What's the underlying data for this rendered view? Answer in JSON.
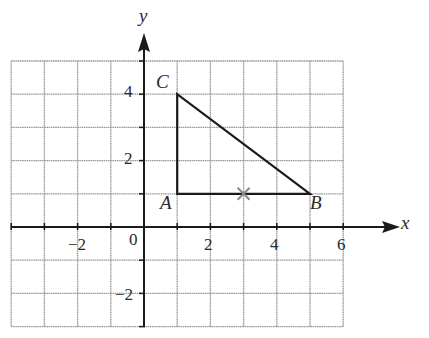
{
  "diagram": {
    "type": "coordinate-grid",
    "axes": {
      "x_label": "x",
      "y_label": "y",
      "origin_label": "0",
      "x_range": [
        -4,
        6
      ],
      "y_range": [
        -3,
        5
      ],
      "x_ticks": [
        {
          "value": -2,
          "label": "−2"
        },
        {
          "value": 2,
          "label": "2"
        },
        {
          "value": 4,
          "label": "4"
        },
        {
          "value": 6,
          "label": "6"
        }
      ],
      "y_ticks": [
        {
          "value": 4,
          "label": "4"
        },
        {
          "value": 2,
          "label": "2"
        },
        {
          "value": -2,
          "label": "−2"
        }
      ]
    },
    "triangle": {
      "vertices": [
        {
          "name": "A",
          "x": 1,
          "y": 1
        },
        {
          "name": "B",
          "x": 5,
          "y": 1
        },
        {
          "name": "C",
          "x": 1,
          "y": 4
        }
      ]
    },
    "marker": {
      "symbol": "cross",
      "x": 3,
      "y": 1
    },
    "colors": {
      "grid": "#9a9a9a",
      "axis": "#1a1a1a",
      "triangle": "#1a1a1a",
      "marker": "#8a8a8a",
      "text": "#2a2a2a"
    }
  }
}
